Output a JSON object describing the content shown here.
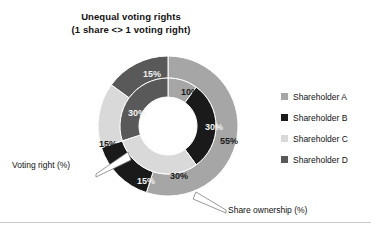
{
  "title": {
    "line1": "Unequal voting rights",
    "line2": "(1 share <> 1 voting right)"
  },
  "legend": {
    "position": "right",
    "items": [
      {
        "label": "Shareholder A",
        "color": "#a6a6a6"
      },
      {
        "label": "Shareholder B",
        "color": "#1a1a1a"
      },
      {
        "label": "Shareholder C",
        "color": "#d9d9d9"
      },
      {
        "label": "Shareholder D",
        "color": "#595959"
      }
    ]
  },
  "callouts": {
    "voting_right": "Voting right (%)",
    "share_ownership": "Share ownership (%)"
  },
  "chart_data": {
    "type": "pie",
    "variant": "nested-donut",
    "title": "Unequal voting rights (1 share <> 1 voting right)",
    "categories": [
      "Shareholder A",
      "Shareholder B",
      "Shareholder C",
      "Shareholder D"
    ],
    "colors": [
      "#a6a6a6",
      "#1a1a1a",
      "#d9d9d9",
      "#595959"
    ],
    "series": [
      {
        "name": "Share ownership (%)",
        "ring": "outer",
        "values": [
          55,
          15,
          15,
          15
        ],
        "labels": [
          "55%",
          "15%",
          "15%",
          "15%"
        ]
      },
      {
        "name": "Voting right (%)",
        "ring": "inner",
        "values": [
          10,
          30,
          30,
          30
        ],
        "labels": [
          "10%",
          "30%",
          "30%",
          "30%"
        ]
      }
    ],
    "start_angle": 0,
    "direction": "clockwise",
    "legend": "right",
    "grid": false,
    "data_labels": [
      {
        "text": "10%",
        "ring": "inner",
        "series": "Voting right (%)",
        "category": "Shareholder A",
        "x": 190,
        "y": 92
      },
      {
        "text": "30%",
        "ring": "inner",
        "series": "Voting right (%)",
        "category": "Shareholder B",
        "x": 214,
        "y": 127
      },
      {
        "text": "55%",
        "ring": "outer",
        "series": "Share ownership (%)",
        "category": "Shareholder A",
        "x": 229,
        "y": 141
      },
      {
        "text": "30%",
        "ring": "inner",
        "series": "Voting right (%)",
        "category": "Shareholder C",
        "x": 179,
        "y": 176
      },
      {
        "text": "15%",
        "ring": "outer",
        "series": "Share ownership (%)",
        "category": "Shareholder B",
        "x": 146,
        "y": 181
      },
      {
        "text": "15%",
        "ring": "outer",
        "series": "Share ownership (%)",
        "category": "Shareholder C",
        "x": 108,
        "y": 144
      },
      {
        "text": "30%",
        "ring": "inner",
        "series": "Voting right (%)",
        "category": "Shareholder D",
        "x": 137,
        "y": 113
      },
      {
        "text": "15%",
        "ring": "outer",
        "series": "Share ownership (%)",
        "category": "Shareholder D",
        "x": 152,
        "y": 74
      }
    ]
  }
}
